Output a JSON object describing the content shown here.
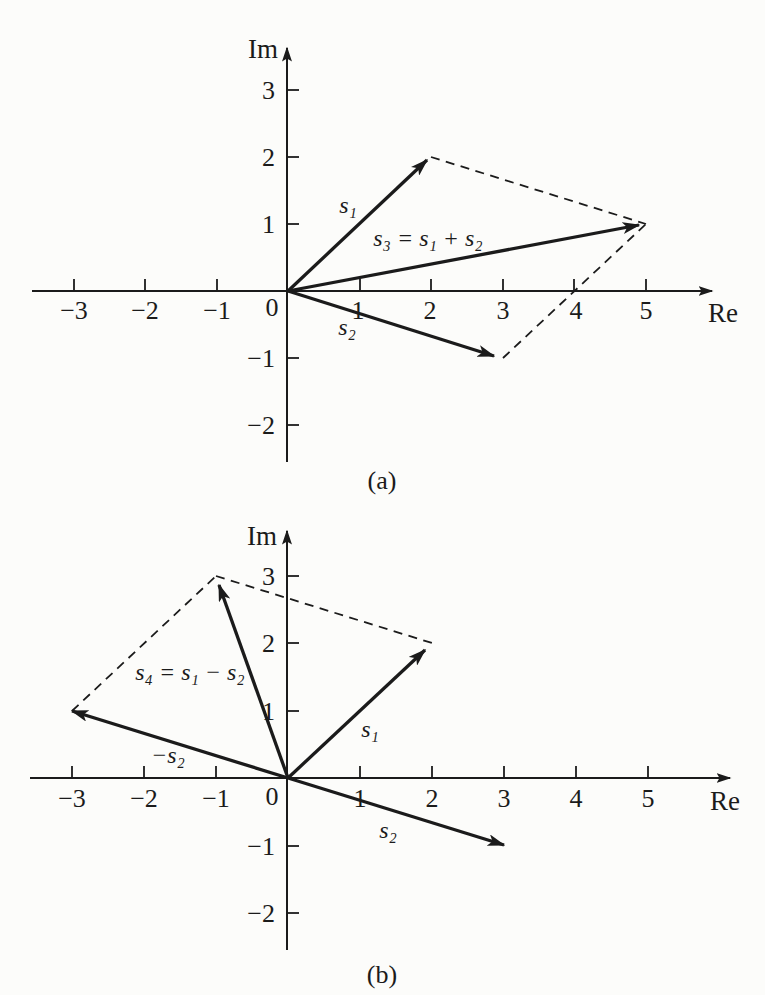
{
  "figure": {
    "background": "#fcfcfa",
    "ink": "#1b1b1b",
    "panel_a": {
      "caption": "(a)",
      "x_axis_label": "Re",
      "y_axis_label": "Im",
      "origin_label": "0",
      "x_tick_labels": [
        "−3",
        "−2",
        "−1",
        "1",
        "2",
        "3",
        "4",
        "5"
      ],
      "y_tick_labels": [
        "3",
        "2",
        "1",
        "−1",
        "−2"
      ],
      "vectors": [
        {
          "name": "s1",
          "label": "s₁",
          "from": [
            0,
            0
          ],
          "to": [
            2,
            2
          ]
        },
        {
          "name": "s2",
          "label": "s₂",
          "from": [
            0,
            0
          ],
          "to": [
            3,
            -1
          ]
        },
        {
          "name": "s3",
          "label": "s₃ = s₁ + s₂",
          "from": [
            0,
            0
          ],
          "to": [
            5,
            1
          ]
        }
      ],
      "dashed_lines": [
        {
          "from": [
            2,
            2
          ],
          "to": [
            5,
            1
          ]
        },
        {
          "from": [
            3,
            -1
          ],
          "to": [
            5,
            1
          ]
        }
      ]
    },
    "panel_b": {
      "caption": "(b)",
      "x_axis_label": "Re",
      "y_axis_label": "Im",
      "origin_label": "0",
      "x_tick_labels": [
        "−3",
        "−2",
        "−1",
        "1",
        "2",
        "3",
        "4",
        "5"
      ],
      "y_tick_labels": [
        "3",
        "2",
        "1",
        "−1",
        "−2"
      ],
      "vectors": [
        {
          "name": "s1",
          "label": "s₁",
          "from": [
            0,
            0
          ],
          "to": [
            2,
            2
          ]
        },
        {
          "name": "s2",
          "label": "s₂",
          "from": [
            0,
            0
          ],
          "to": [
            3,
            -1
          ]
        },
        {
          "name": "neg_s2",
          "label": "−s₂",
          "from": [
            0,
            0
          ],
          "to": [
            -3,
            1
          ]
        },
        {
          "name": "s4",
          "label": "s₄ = s₁ − s₂",
          "from": [
            0,
            0
          ],
          "to": [
            -1,
            3
          ]
        }
      ],
      "dashed_lines": [
        {
          "from": [
            -3,
            1
          ],
          "to": [
            -1,
            3
          ]
        },
        {
          "from": [
            -1,
            3
          ],
          "to": [
            2,
            2
          ]
        }
      ]
    }
  }
}
